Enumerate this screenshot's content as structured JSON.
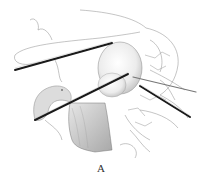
{
  "figure": {
    "caption": "A",
    "colors": {
      "background": "#ffffff",
      "line": "#777777",
      "instrument": "#1a1a1a",
      "shade": "#cfcfcf"
    }
  }
}
